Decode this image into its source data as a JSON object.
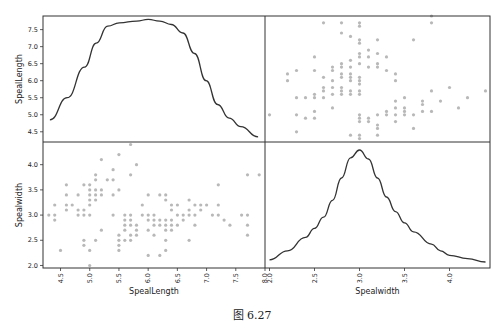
{
  "caption": "图 6.27",
  "chart_data": {
    "type": "scatter_matrix",
    "variables": [
      "SpealLength",
      "Spealwidth"
    ],
    "diagonal": "kde",
    "panels": [
      {
        "position": "top-left",
        "type": "line",
        "kind": "kde",
        "variable": "SpealLength",
        "ylabel": "SpealLength",
        "yticks": [
          "4.5",
          "5.0",
          "5.5",
          "6.0",
          "6.5",
          "7.0",
          "7.5"
        ],
        "ylim": [
          4.2,
          7.9
        ],
        "curve_points": [
          [
            4.3,
            4.85
          ],
          [
            4.6,
            5.5
          ],
          [
            4.9,
            6.4
          ],
          [
            5.1,
            7.1
          ],
          [
            5.3,
            7.6
          ],
          [
            5.5,
            7.7
          ],
          [
            5.8,
            7.75
          ],
          [
            6.0,
            7.8
          ],
          [
            6.2,
            7.75
          ],
          [
            6.4,
            7.65
          ],
          [
            6.6,
            7.4
          ],
          [
            6.8,
            6.8
          ],
          [
            7.0,
            6.0
          ],
          [
            7.2,
            5.3
          ],
          [
            7.4,
            4.9
          ],
          [
            7.6,
            4.65
          ],
          [
            7.9,
            4.35
          ]
        ]
      },
      {
        "position": "top-right",
        "type": "scatter",
        "x": "Spealwidth",
        "y": "SpealLength",
        "xlim": [
          1.95,
          4.45
        ],
        "ylim": [
          4.2,
          7.9
        ],
        "points": [
          [
            2.0,
            5.0
          ],
          [
            2.2,
            6.0
          ],
          [
            2.2,
            6.2
          ],
          [
            2.3,
            4.5
          ],
          [
            2.3,
            5.0
          ],
          [
            2.3,
            5.5
          ],
          [
            2.3,
            6.3
          ],
          [
            2.4,
            4.9
          ],
          [
            2.4,
            5.5
          ],
          [
            2.5,
            4.9
          ],
          [
            2.5,
            5.1
          ],
          [
            2.5,
            5.5
          ],
          [
            2.5,
            5.6
          ],
          [
            2.5,
            6.3
          ],
          [
            2.5,
            6.7
          ],
          [
            2.6,
            5.5
          ],
          [
            2.6,
            5.7
          ],
          [
            2.6,
            5.8
          ],
          [
            2.6,
            6.1
          ],
          [
            2.6,
            7.7
          ],
          [
            2.7,
            5.2
          ],
          [
            2.7,
            5.6
          ],
          [
            2.7,
            5.8
          ],
          [
            2.7,
            6.0
          ],
          [
            2.7,
            6.3
          ],
          [
            2.7,
            6.4
          ],
          [
            2.8,
            5.6
          ],
          [
            2.8,
            5.7
          ],
          [
            2.8,
            5.8
          ],
          [
            2.8,
            6.1
          ],
          [
            2.8,
            6.2
          ],
          [
            2.8,
            6.4
          ],
          [
            2.8,
            6.5
          ],
          [
            2.8,
            7.4
          ],
          [
            2.8,
            7.7
          ],
          [
            2.9,
            4.4
          ],
          [
            2.9,
            5.6
          ],
          [
            2.9,
            5.7
          ],
          [
            2.9,
            6.0
          ],
          [
            2.9,
            6.1
          ],
          [
            2.9,
            6.2
          ],
          [
            2.9,
            6.4
          ],
          [
            2.9,
            6.6
          ],
          [
            2.9,
            7.3
          ],
          [
            3.0,
            4.3
          ],
          [
            3.0,
            4.4
          ],
          [
            3.0,
            4.8
          ],
          [
            3.0,
            4.9
          ],
          [
            3.0,
            5.0
          ],
          [
            3.0,
            5.6
          ],
          [
            3.0,
            5.7
          ],
          [
            3.0,
            5.9
          ],
          [
            3.0,
            6.0
          ],
          [
            3.0,
            6.1
          ],
          [
            3.0,
            6.5
          ],
          [
            3.0,
            6.7
          ],
          [
            3.0,
            6.8
          ],
          [
            3.0,
            7.1
          ],
          [
            3.0,
            7.2
          ],
          [
            3.0,
            7.6
          ],
          [
            3.0,
            7.7
          ],
          [
            3.1,
            4.8
          ],
          [
            3.1,
            4.9
          ],
          [
            3.1,
            6.4
          ],
          [
            3.1,
            6.7
          ],
          [
            3.1,
            6.9
          ],
          [
            3.2,
            4.4
          ],
          [
            3.2,
            4.6
          ],
          [
            3.2,
            4.7
          ],
          [
            3.2,
            5.0
          ],
          [
            3.2,
            6.4
          ],
          [
            3.2,
            6.5
          ],
          [
            3.2,
            6.8
          ],
          [
            3.2,
            7.2
          ],
          [
            3.3,
            5.0
          ],
          [
            3.3,
            5.1
          ],
          [
            3.3,
            6.3
          ],
          [
            3.3,
            6.7
          ],
          [
            3.4,
            4.8
          ],
          [
            3.4,
            5.0
          ],
          [
            3.4,
            5.2
          ],
          [
            3.4,
            5.4
          ],
          [
            3.4,
            6.0
          ],
          [
            3.4,
            6.2
          ],
          [
            3.5,
            5.0
          ],
          [
            3.5,
            5.1
          ],
          [
            3.5,
            5.2
          ],
          [
            3.5,
            5.5
          ],
          [
            3.6,
            4.6
          ],
          [
            3.6,
            5.0
          ],
          [
            3.6,
            7.2
          ],
          [
            3.7,
            5.1
          ],
          [
            3.7,
            5.3
          ],
          [
            3.7,
            5.4
          ],
          [
            3.8,
            5.1
          ],
          [
            3.8,
            5.7
          ],
          [
            3.8,
            7.7
          ],
          [
            3.8,
            7.9
          ],
          [
            3.9,
            5.4
          ],
          [
            4.0,
            5.8
          ],
          [
            4.1,
            5.2
          ],
          [
            4.2,
            5.5
          ],
          [
            4.4,
            5.7
          ]
        ]
      },
      {
        "position": "bottom-left",
        "type": "scatter",
        "x": "SpealLength",
        "y": "Spealwidth",
        "xlabel": "SpealLength",
        "ylabel": "Spealwidth",
        "xticks": [
          "4.5",
          "5.0",
          "5.5",
          "6.0",
          "6.5",
          "7.0",
          "7.5",
          "8.0"
        ],
        "yticks": [
          "2.0",
          "2.5",
          "3.0",
          "3.5",
          "4.0"
        ],
        "xlim": [
          4.2,
          8.0
        ],
        "ylim": [
          1.95,
          4.45
        ],
        "points": [
          [
            4.3,
            3.0
          ],
          [
            4.4,
            2.9
          ],
          [
            4.4,
            3.0
          ],
          [
            4.4,
            3.2
          ],
          [
            4.5,
            2.3
          ],
          [
            4.6,
            3.1
          ],
          [
            4.6,
            3.2
          ],
          [
            4.6,
            3.4
          ],
          [
            4.6,
            3.6
          ],
          [
            4.7,
            3.2
          ],
          [
            4.8,
            3.0
          ],
          [
            4.8,
            3.1
          ],
          [
            4.8,
            3.4
          ],
          [
            4.9,
            2.4
          ],
          [
            4.9,
            2.5
          ],
          [
            4.9,
            3.0
          ],
          [
            4.9,
            3.1
          ],
          [
            4.9,
            3.6
          ],
          [
            5.0,
            2.0
          ],
          [
            5.0,
            2.3
          ],
          [
            5.0,
            3.0
          ],
          [
            5.0,
            3.2
          ],
          [
            5.0,
            3.3
          ],
          [
            5.0,
            3.4
          ],
          [
            5.0,
            3.5
          ],
          [
            5.0,
            3.6
          ],
          [
            5.1,
            2.5
          ],
          [
            5.1,
            3.3
          ],
          [
            5.1,
            3.4
          ],
          [
            5.1,
            3.5
          ],
          [
            5.1,
            3.7
          ],
          [
            5.1,
            3.8
          ],
          [
            5.2,
            2.7
          ],
          [
            5.2,
            3.4
          ],
          [
            5.2,
            3.5
          ],
          [
            5.2,
            4.1
          ],
          [
            5.3,
            3.7
          ],
          [
            5.4,
            3.0
          ],
          [
            5.4,
            3.4
          ],
          [
            5.4,
            3.7
          ],
          [
            5.4,
            3.9
          ],
          [
            5.5,
            2.3
          ],
          [
            5.5,
            2.4
          ],
          [
            5.5,
            2.5
          ],
          [
            5.5,
            2.6
          ],
          [
            5.5,
            3.5
          ],
          [
            5.5,
            4.2
          ],
          [
            5.6,
            2.5
          ],
          [
            5.6,
            2.7
          ],
          [
            5.6,
            2.8
          ],
          [
            5.6,
            2.9
          ],
          [
            5.6,
            3.0
          ],
          [
            5.7,
            2.5
          ],
          [
            5.7,
            2.6
          ],
          [
            5.7,
            2.8
          ],
          [
            5.7,
            2.9
          ],
          [
            5.7,
            3.0
          ],
          [
            5.7,
            3.8
          ],
          [
            5.7,
            4.4
          ],
          [
            5.8,
            2.6
          ],
          [
            5.8,
            2.7
          ],
          [
            5.8,
            2.8
          ],
          [
            5.8,
            4.0
          ],
          [
            5.9,
            3.0
          ],
          [
            5.9,
            3.2
          ],
          [
            6.0,
            2.2
          ],
          [
            6.0,
            2.7
          ],
          [
            6.0,
            2.9
          ],
          [
            6.0,
            3.0
          ],
          [
            6.0,
            3.4
          ],
          [
            6.1,
            2.6
          ],
          [
            6.1,
            2.8
          ],
          [
            6.1,
            2.9
          ],
          [
            6.1,
            3.0
          ],
          [
            6.2,
            2.2
          ],
          [
            6.2,
            2.8
          ],
          [
            6.2,
            2.9
          ],
          [
            6.2,
            3.4
          ],
          [
            6.3,
            2.3
          ],
          [
            6.3,
            2.5
          ],
          [
            6.3,
            2.7
          ],
          [
            6.3,
            2.8
          ],
          [
            6.3,
            2.9
          ],
          [
            6.3,
            3.3
          ],
          [
            6.3,
            3.4
          ],
          [
            6.4,
            2.7
          ],
          [
            6.4,
            2.8
          ],
          [
            6.4,
            2.9
          ],
          [
            6.4,
            3.1
          ],
          [
            6.4,
            3.2
          ],
          [
            6.5,
            2.8
          ],
          [
            6.5,
            3.0
          ],
          [
            6.5,
            3.2
          ],
          [
            6.6,
            2.9
          ],
          [
            6.6,
            3.0
          ],
          [
            6.7,
            2.5
          ],
          [
            6.7,
            3.0
          ],
          [
            6.7,
            3.1
          ],
          [
            6.7,
            3.3
          ],
          [
            6.8,
            2.8
          ],
          [
            6.8,
            3.0
          ],
          [
            6.8,
            3.2
          ],
          [
            6.9,
            3.1
          ],
          [
            6.9,
            3.2
          ],
          [
            7.0,
            3.2
          ],
          [
            7.1,
            3.0
          ],
          [
            7.2,
            3.0
          ],
          [
            7.2,
            3.2
          ],
          [
            7.2,
            3.6
          ],
          [
            7.3,
            2.9
          ],
          [
            7.4,
            2.8
          ],
          [
            7.6,
            3.0
          ],
          [
            7.7,
            2.6
          ],
          [
            7.7,
            2.8
          ],
          [
            7.7,
            3.0
          ],
          [
            7.7,
            3.8
          ],
          [
            7.9,
            3.8
          ]
        ]
      },
      {
        "position": "bottom-right",
        "type": "line",
        "kind": "kde",
        "variable": "Spealwidth",
        "xlabel": "Spealwidth",
        "xticks": [
          "2.0",
          "2.5",
          "3.0",
          "3.5",
          "4.0"
        ],
        "xlim": [
          1.95,
          4.45
        ],
        "curve_points": [
          [
            2.0,
            0.02
          ],
          [
            2.2,
            0.1
          ],
          [
            2.4,
            0.22
          ],
          [
            2.5,
            0.3
          ],
          [
            2.6,
            0.4
          ],
          [
            2.7,
            0.55
          ],
          [
            2.8,
            0.75
          ],
          [
            2.9,
            0.93
          ],
          [
            3.0,
            1.0
          ],
          [
            3.1,
            0.92
          ],
          [
            3.2,
            0.75
          ],
          [
            3.3,
            0.58
          ],
          [
            3.4,
            0.45
          ],
          [
            3.5,
            0.35
          ],
          [
            3.6,
            0.27
          ],
          [
            3.8,
            0.16
          ],
          [
            3.9,
            0.1
          ],
          [
            4.0,
            0.06
          ],
          [
            4.2,
            0.03
          ],
          [
            4.4,
            0.0
          ]
        ]
      }
    ],
    "grid": false,
    "legend": null
  }
}
